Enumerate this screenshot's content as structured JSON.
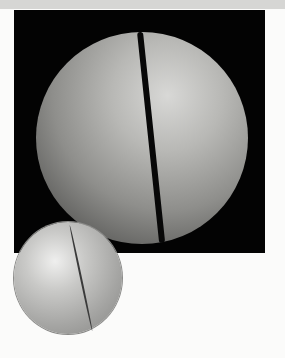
{
  "image": {
    "description": "Photograph of a cracked sphere on black background, with a smaller rendered split sphere overlapping the lower-left corner",
    "show_through_text": ""
  }
}
